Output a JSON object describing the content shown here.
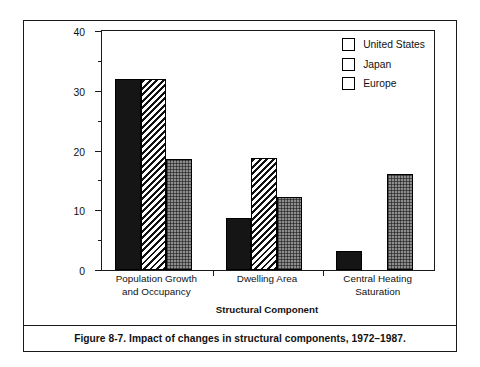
{
  "figure": {
    "caption": "Figure 8-7.  Impact of changes in structural components, 1972–1987."
  },
  "chart_data": {
    "type": "bar",
    "title": "",
    "xlabel": "Structural Component",
    "ylabel": "Change in Delivered Space Heating from 1972 to 1987 (percent)",
    "ylabel_line1": "Change in Delivered Space Heating",
    "ylabel_line2": "from 1972 to 1987 (percent)",
    "categories": [
      "Population Growth and Occupancy",
      "Dwelling Area",
      "Central Heating Saturation"
    ],
    "category_lines": [
      [
        "Population Growth",
        "and Occupancy"
      ],
      [
        "Dwelling Area",
        ""
      ],
      [
        "Central Heating",
        "Saturation"
      ]
    ],
    "series": [
      {
        "name": "United States",
        "pattern": "solid-black",
        "color": "#151515",
        "values": [
          32.0,
          8.7,
          3.2
        ]
      },
      {
        "name": "Japan",
        "pattern": "diagonal-hatch",
        "color": "#111111",
        "values": [
          32.0,
          18.7,
          null
        ]
      },
      {
        "name": "Europe",
        "pattern": "checker-gray",
        "color": "#8d8d8d",
        "values": [
          18.6,
          12.2,
          16.0
        ]
      }
    ],
    "ylim": [
      0,
      40
    ],
    "yticks": [
      0,
      10,
      20,
      30,
      40
    ],
    "ytick_labels": [
      "0",
      "10",
      "20",
      "30",
      "40"
    ],
    "yticks_minor": [
      5,
      15,
      25,
      35
    ],
    "grid": false,
    "legend_position": "top-right",
    "legend_entries": [
      "United States",
      "Japan",
      "Europe"
    ]
  }
}
